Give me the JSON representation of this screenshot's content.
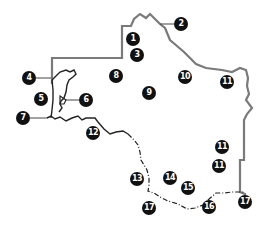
{
  "map": {
    "colors": {
      "border_state": "#7a7a7a",
      "border_river": "#222222",
      "border_dashed": "#222222",
      "marker_fill": "#111111",
      "marker_text": "#ffffff",
      "background": "#ffffff"
    },
    "markers": [
      {
        "label": "1",
        "x": 133,
        "y": 39
      },
      {
        "label": "2",
        "x": 181,
        "y": 24
      },
      {
        "label": "3",
        "x": 137,
        "y": 55
      },
      {
        "label": "4",
        "x": 29,
        "y": 78
      },
      {
        "label": "5",
        "x": 41,
        "y": 99
      },
      {
        "label": "6",
        "x": 86,
        "y": 100
      },
      {
        "label": "7",
        "x": 23,
        "y": 118
      },
      {
        "label": "8",
        "x": 116,
        "y": 76
      },
      {
        "label": "9",
        "x": 149,
        "y": 93
      },
      {
        "label": "10",
        "x": 185,
        "y": 77
      },
      {
        "label": "11",
        "x": 227,
        "y": 82
      },
      {
        "label": "11",
        "x": 222,
        "y": 147
      },
      {
        "label": "11",
        "x": 219,
        "y": 166
      },
      {
        "label": "12",
        "x": 93,
        "y": 133
      },
      {
        "label": "13",
        "x": 137,
        "y": 179
      },
      {
        "label": "14",
        "x": 170,
        "y": 178
      },
      {
        "label": "15",
        "x": 188,
        "y": 188
      },
      {
        "label": "16",
        "x": 209,
        "y": 207
      },
      {
        "label": "17",
        "x": 149,
        "y": 208
      },
      {
        "label": "17",
        "x": 245,
        "y": 202
      }
    ]
  }
}
